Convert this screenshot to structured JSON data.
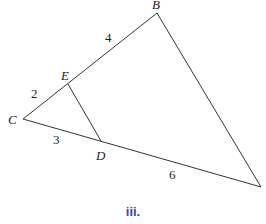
{
  "diagram": {
    "vertices": {
      "B": {
        "label": "B",
        "x": 157,
        "y": 13
      },
      "C": {
        "label": "C",
        "x": 23,
        "y": 119
      },
      "E": {
        "label": "E",
        "x": 68,
        "y": 84
      },
      "D": {
        "label": "D",
        "x": 101,
        "y": 141
      },
      "A": {
        "label": "",
        "x": 261,
        "y": 187
      }
    },
    "segment_labels": {
      "EB": "4",
      "CE": "2",
      "CD": "3",
      "DA": "6"
    },
    "caption": "iii.",
    "colors": {
      "line": "#333333",
      "caption": "#3b4aa8"
    }
  }
}
